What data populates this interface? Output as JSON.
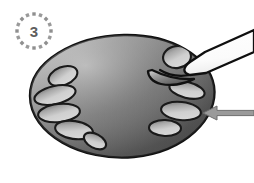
{
  "figure": {
    "background_color": "#ffffff"
  },
  "step_badge": {
    "name": "step-badge",
    "number": "3",
    "number_color": "#5e5e5e",
    "ring_dash_color": "#8f8f8f",
    "ring_dash_count": 16,
    "center_x": 34,
    "center_y": 31,
    "ring_radius": 17,
    "dash_size": 3.4
  },
  "cell": {
    "name": "cell-body",
    "label": "cell",
    "outline_color": "#111111",
    "outline_width": 2.4,
    "fill_light": "#c9c9c9",
    "fill_mid": "#7a7a7a",
    "fill_dark": "#4a4a4a",
    "path": "M 30 96 C 30 62 74 36 124 35 C 172 34 209 57 214 86 C 219 118 185 152 134 157 C 82 162 30 134 30 96 Z"
  },
  "organelles": {
    "name": "organelle-group",
    "label": "organelles",
    "outline_color": "#1a1a1a",
    "outline_width": 2.1,
    "fill_light": "#d8d8d8",
    "fill_dark": "#6a6a6a",
    "items": [
      {
        "name": "organelle-1",
        "cx": 63,
        "cy": 76,
        "rx": 15,
        "ry": 9,
        "rot": -21
      },
      {
        "name": "organelle-2",
        "cx": 55,
        "cy": 95,
        "rx": 21,
        "ry": 9,
        "rot": -13
      },
      {
        "name": "organelle-3",
        "cx": 59,
        "cy": 113,
        "rx": 21,
        "ry": 9,
        "rot": -6
      },
      {
        "name": "organelle-4",
        "cx": 74,
        "cy": 130,
        "rx": 19,
        "ry": 9,
        "rot": 8
      },
      {
        "name": "organelle-5",
        "cx": 95,
        "cy": 141,
        "rx": 12,
        "ry": 7,
        "rot": 28
      },
      {
        "name": "organelle-6",
        "cx": 177,
        "cy": 57,
        "rx": 14,
        "ry": 11,
        "rot": -8
      },
      {
        "name": "organelle-7",
        "cx": 187,
        "cy": 90,
        "rx": 18,
        "ry": 8,
        "rot": 14
      },
      {
        "name": "organelle-8",
        "cx": 181,
        "cy": 111,
        "rx": 20,
        "ry": 9,
        "rot": 6
      },
      {
        "name": "organelle-9",
        "cx": 165,
        "cy": 128,
        "rx": 16,
        "ry": 8,
        "rot": 2
      }
    ]
  },
  "pipette": {
    "name": "micropipette",
    "label": "micropipette",
    "outline_color": "#0f0f0f",
    "outline_width": 2.3,
    "fill_color": "#ffffff",
    "path": "M 254 33 L 199 58 L 188 68 C 183 72 183 76 190 77 L 203 75 L 254 55 Z",
    "tip_path": "M 190 77 C 178 79 170 77 165 73"
  },
  "membrane_pinch": {
    "name": "membrane-pinch",
    "outline_color": "#111111",
    "outline_width": 2.3,
    "path": "M 160 68 C 172 72 182 76 193 78 C 184 81 175 82 167 81 C 160 80 156 76 154 72 Z"
  },
  "arrow": {
    "name": "pointer-arrow",
    "label": "arrow",
    "direction": "left",
    "fill_color": "#9a9a9a",
    "outline_color": "#6f6f6f",
    "outline_width": 1,
    "tip_x": 203,
    "tip_y": 113,
    "tail_x": 254,
    "tail_y": 113,
    "head_length": 14,
    "head_half_height": 7,
    "shaft_half_height": 2.6
  }
}
